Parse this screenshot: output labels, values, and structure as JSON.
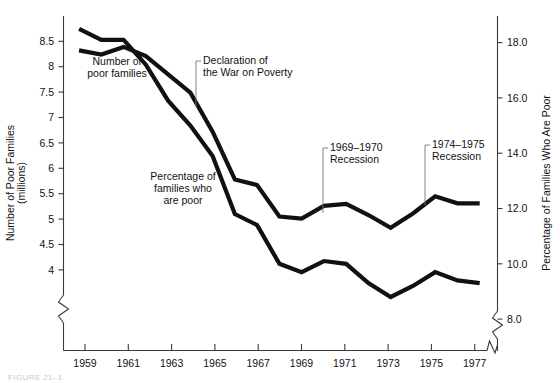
{
  "chart_data": {
    "type": "line",
    "title": "",
    "xlabel": "",
    "ylabel": "Number of Poor Families (millions)",
    "ylabel_right": "Percentage of Families Who Are Poor",
    "grid": false,
    "legend": "inline-annotations",
    "x": [
      1959,
      1960,
      1961,
      1962,
      1963,
      1964,
      1965,
      1966,
      1967,
      1968,
      1969,
      1970,
      1971,
      1972,
      1973,
      1974,
      1975,
      1976,
      1977
    ],
    "xticks": [
      "1959",
      "1961",
      "1963",
      "1965",
      "1967",
      "1969",
      "1971",
      "1973",
      "1975",
      "1977"
    ],
    "xlim": [
      1958.3,
      1977.8
    ],
    "yticks_left": [
      "8.5",
      "8",
      "7.5",
      "7",
      "6.5",
      "6",
      "5.5",
      "5",
      "4.5",
      "4"
    ],
    "yticks_left_values": [
      8.5,
      8,
      7.5,
      7,
      6.5,
      6,
      5.5,
      5,
      4.5,
      4
    ],
    "ylim_left": [
      3.55,
      9.05
    ],
    "yticks_right": [
      "18.0",
      "16.0",
      "14.0",
      "12.0",
      "10.0",
      "8.0"
    ],
    "yticks_right_values": [
      18.0,
      16.0,
      14.0,
      12.0,
      10.0,
      8.0
    ],
    "ylim_right": [
      7.1,
      19.3
    ],
    "axis_break_left": true,
    "axis_break_right": true,
    "axis_break_x": true,
    "series": [
      {
        "name": "Number of poor families",
        "axis": "left",
        "units": "millions",
        "values": [
          8.32,
          8.24,
          8.39,
          8.21,
          7.85,
          7.49,
          6.72,
          5.78,
          5.67,
          5.05,
          5.01,
          5.26,
          5.3,
          5.08,
          4.83,
          5.11,
          5.45,
          5.31,
          5.31
        ]
      },
      {
        "name": "Percentage of families who are poor",
        "axis": "right",
        "units": "percent",
        "values": [
          18.5,
          18.1,
          18.1,
          17.2,
          15.9,
          15.0,
          13.9,
          11.8,
          11.4,
          10.0,
          9.7,
          10.1,
          10.0,
          9.3,
          8.8,
          9.2,
          9.7,
          9.4,
          9.3
        ]
      }
    ],
    "annotations": [
      {
        "name": "poor-families-label",
        "text_lines": [
          "Number of",
          "poor families"
        ]
      },
      {
        "name": "percentage-label",
        "text_lines": [
          "Percentage of",
          "families who",
          "are poor"
        ]
      },
      {
        "name": "war-on-poverty-label",
        "text_lines": [
          "Declaration of",
          "the War on Poverty"
        ],
        "year": 1964
      },
      {
        "name": "recession-1969-label",
        "text_lines": [
          "1969–1970",
          "Recession"
        ],
        "year": 1969
      },
      {
        "name": "recession-1974-label",
        "text_lines": [
          "1974–1975",
          "Recession"
        ],
        "year": 1974
      }
    ],
    "colors": {
      "line": "#111111",
      "axis": "#3a3a3a",
      "leader": "#777777",
      "background": "#ffffff"
    }
  },
  "caption": {
    "text": "FIGURE 21–1"
  }
}
